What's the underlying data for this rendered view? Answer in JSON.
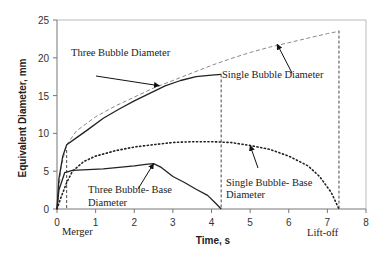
{
  "chart_data": {
    "type": "line",
    "title": "",
    "xlabel": "Time, s",
    "ylabel": "Equivalent Diameter, mm",
    "xlim": [
      0,
      8
    ],
    "ylim": [
      0,
      25
    ],
    "xticks": [
      "0",
      "1",
      "2",
      "3",
      "4",
      "5",
      "6",
      "7",
      "8"
    ],
    "yticks": [
      "0",
      "5",
      "10",
      "15",
      "20",
      "25"
    ],
    "grid": false,
    "legend": "none (inline annotations)",
    "series": [
      {
        "name": "Single Bubble Diameter",
        "style": "dashed",
        "color": "#888888",
        "x": [
          0,
          0.1,
          0.25,
          0.5,
          1.0,
          1.5,
          2.0,
          2.5,
          3.0,
          3.5,
          4.0,
          4.5,
          5.0,
          5.5,
          6.0,
          6.5,
          7.0,
          7.3
        ],
        "y": [
          0,
          5.5,
          8.5,
          10.3,
          12.2,
          13.6,
          14.8,
          16.0,
          17.0,
          18.0,
          19.0,
          19.9,
          20.7,
          21.4,
          22.0,
          22.6,
          23.2,
          23.5
        ]
      },
      {
        "name": "Three Bubble Diameter",
        "style": "solid",
        "color": "#222222",
        "x": [
          0,
          0.05,
          0.15,
          0.25,
          0.5,
          0.8,
          1.2,
          1.6,
          2.0,
          2.4,
          2.8,
          3.2,
          3.6,
          4.0,
          4.25
        ],
        "y": [
          0,
          4.0,
          7.0,
          8.5,
          9.4,
          10.5,
          12.0,
          13.2,
          14.3,
          15.3,
          16.3,
          17.0,
          17.5,
          17.7,
          17.8
        ]
      },
      {
        "name": "Three Bubble- Base Diameter",
        "style": "solid",
        "color": "#222222",
        "x": [
          0,
          0.05,
          0.2,
          0.4,
          0.8,
          1.2,
          1.6,
          2.0,
          2.3,
          2.5,
          2.7,
          3.0,
          3.3,
          3.6,
          3.9,
          4.1,
          4.25
        ],
        "y": [
          0,
          2.5,
          4.8,
          5.1,
          5.2,
          5.3,
          5.5,
          5.7,
          5.9,
          6.0,
          5.5,
          4.3,
          3.5,
          2.6,
          1.8,
          0.8,
          0
        ]
      },
      {
        "name": "Single Bubble- Base Diameter",
        "style": "dotted",
        "color": "#222222",
        "x": [
          0,
          0.1,
          0.25,
          0.4,
          0.7,
          1.0,
          1.5,
          2.0,
          2.5,
          3.0,
          3.5,
          4.0,
          4.5,
          5.0,
          5.5,
          6.0,
          6.5,
          6.8,
          7.1,
          7.3
        ],
        "y": [
          0,
          1.5,
          3.5,
          5.0,
          6.3,
          7.0,
          7.7,
          8.2,
          8.5,
          8.8,
          8.9,
          8.9,
          8.8,
          8.4,
          7.9,
          7.0,
          5.7,
          4.3,
          2.2,
          0
        ]
      }
    ],
    "vertical_markers": [
      {
        "x": 0.25,
        "label": "Merger",
        "style": "dashed"
      },
      {
        "x": 4.25,
        "label": "",
        "style": "dashed"
      },
      {
        "x": 7.3,
        "label": "Lift-off",
        "style": "dashed"
      }
    ],
    "annotations": [
      {
        "text": "Three Bubble Diameter",
        "arrow_to": [
          2.65,
          16.3
        ]
      },
      {
        "text": "Single Bubble Diameter",
        "arrow_to": [
          5.7,
          21.8
        ]
      },
      {
        "text": "Three Bubble- Base Diameter",
        "arrow_to": [
          2.5,
          6.0
        ]
      },
      {
        "text": "Single Bubble- Base Diameter",
        "arrow_to": [
          5.0,
          8.4
        ]
      }
    ]
  },
  "labels": {
    "xlabel": "Time, s",
    "ylabel": "Equivalent Diameter, mm",
    "merger": "Merger",
    "liftoff": "Lift-off",
    "three_bubble_diameter": "Three Bubble Diameter",
    "single_bubble_diameter": "Single Bubble Diameter",
    "three_base_line1": "Three Bubble- Base",
    "three_base_line2": "Diameter",
    "single_base_line1": "Single Bubble- Base",
    "single_base_line2": "Diameter"
  }
}
